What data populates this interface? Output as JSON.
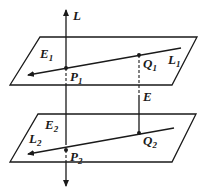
{
  "diagram": {
    "type": "geometry-two-planes-skew-lines",
    "labels": {
      "line_L": "L",
      "plane_1": "E",
      "plane_1_sub": "1",
      "plane_2": "E",
      "plane_2_sub": "2",
      "line_1": "L",
      "line_1_sub": "1",
      "line_2": "L",
      "line_2_sub": "2",
      "point_P1": "P",
      "point_P1_sub": "1",
      "point_Q1": "Q",
      "point_Q1_sub": "1",
      "point_P2": "P",
      "point_P2_sub": "2",
      "point_Q2": "Q",
      "point_Q2_sub": "2",
      "segment_E": "E"
    },
    "colors": {
      "stroke": "#1a1a1a",
      "background": "#ffffff"
    }
  }
}
